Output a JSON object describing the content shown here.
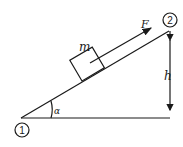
{
  "diagram": {
    "labels": {
      "mass": "m",
      "force": "F",
      "height": "h",
      "angle": "α",
      "point_start": "1",
      "point_end": "2"
    },
    "colors": {
      "stroke": "#1a1a1a",
      "background": "#ffffff"
    }
  }
}
